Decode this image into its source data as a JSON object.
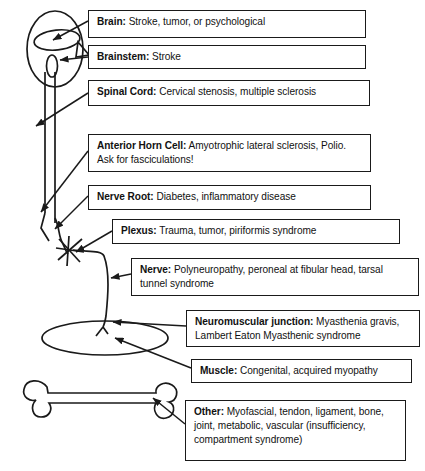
{
  "diagram": {
    "line_color": "#1a1a1a",
    "box_border_color": "#1a1a1a",
    "background": "#ffffff"
  },
  "labels": {
    "brain": {
      "term": "Brain:",
      "desc": "Stroke, tumor, or psychological"
    },
    "brainstem": {
      "term": "Brainstem:",
      "desc": "Stroke"
    },
    "spinal_cord": {
      "term": "Spinal Cord:",
      "desc": "Cervical stenosis, multiple sclerosis"
    },
    "anterior_horn_cell": {
      "term": "Anterior Horn Cell:",
      "desc": "Amyotrophic lateral sclerosis, Polio. Ask for fasciculations!"
    },
    "nerve_root": {
      "term": "Nerve Root:",
      "desc": "Diabetes, inflammatory disease"
    },
    "plexus": {
      "term": "Plexus:",
      "desc": "Trauma, tumor, piriformis syndrome"
    },
    "nerve": {
      "term": "Nerve:",
      "desc": "Polyneuropathy, peroneal at fibular head, tarsal tunnel syndrome"
    },
    "neuromuscular_junction": {
      "term": "Neuromuscular junction:",
      "desc": "Myasthenia gravis, Lambert Eaton Myasthenic syndrome"
    },
    "muscle": {
      "term": "Muscle:",
      "desc": "Congenital, acquired myopathy"
    },
    "other": {
      "term": "Other:",
      "desc": "Myofascial, tendon, ligament, bone, joint, metabolic, vascular (insufficiency, compartment syndrome)"
    }
  },
  "anatomy": {
    "head_label": "head-outline",
    "brain_label": "brain-ellipse",
    "brainstem_label": "brainstem-oval",
    "nose_label": "nose-triangle",
    "spinal_cord_label": "spinal-cord-column",
    "plexus_label": "plexus-star",
    "nerve_label": "peripheral-nerve-line",
    "muscle_label": "muscle-ellipse",
    "bone_label": "bone-shape"
  }
}
